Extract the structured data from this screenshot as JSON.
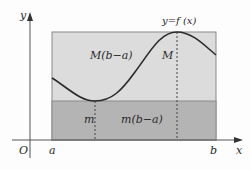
{
  "figure": {
    "colors": {
      "upper_fill": "#dcdcdc",
      "lower_fill": "#b4b4b4",
      "curve": "#2b2b2b",
      "axis": "#555555",
      "rect_border": "#8a8a8a",
      "dashed": "#444444"
    },
    "labels": {
      "y_axis": "y",
      "x_axis": "x",
      "origin": "O",
      "a": "a",
      "b": "b",
      "function": "y=f (x)",
      "upper_area": "M(b−a)",
      "lower_area": "m(b−a)",
      "max": "M",
      "min": "m"
    },
    "geometry": {
      "axis_origin_px": [
        30,
        140
      ],
      "rect_px": {
        "left": 52,
        "right": 216,
        "top": 32,
        "bottom": 140
      },
      "lower_band_top_px": 101,
      "min_point_px": [
        95,
        101
      ],
      "max_point_px": [
        177,
        32
      ],
      "curve_start_px": [
        52,
        78
      ],
      "curve_end_px": [
        216,
        55
      ]
    }
  }
}
